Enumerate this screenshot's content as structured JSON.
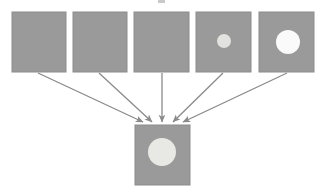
{
  "diagram": {
    "title": "",
    "type": "convergent-arrow-diagram",
    "canvas": {
      "width": 322,
      "height": 192,
      "background": "#ffffff"
    },
    "colors": {
      "box_fill": "#9a9a9a",
      "box_border": "#8c8c8c",
      "arrow_stroke": "#8a8a8a",
      "circle_bright": "#fafafa",
      "circle_medium": "#e2e2de",
      "circle_soft": "#e8e8e4",
      "page_background": "#ffffff"
    },
    "top_row": {
      "label": "source-frames-row",
      "count": 5,
      "boxes": [
        {
          "id": "frame-1",
          "label": "",
          "x": 12,
          "y": 12,
          "width": 54,
          "height": 60,
          "fill": "#9a9a9a",
          "circle": null
        },
        {
          "id": "frame-2",
          "label": "",
          "x": 73,
          "y": 12,
          "width": 54,
          "height": 60,
          "fill": "#9a9a9a",
          "circle": null
        },
        {
          "id": "frame-3",
          "label": "",
          "x": 134,
          "y": 12,
          "width": 55,
          "height": 60,
          "fill": "#9a9a9a",
          "circle": null
        },
        {
          "id": "frame-4",
          "label": "",
          "x": 196,
          "y": 12,
          "width": 55,
          "height": 60,
          "fill": "#9a9a9a",
          "circle": {
            "cx": 224,
            "cy": 41,
            "r": 7,
            "fill": "#e2e2de"
          }
        },
        {
          "id": "frame-5",
          "label": "",
          "x": 259,
          "y": 12,
          "width": 55,
          "height": 60,
          "fill": "#9a9a9a",
          "circle": {
            "cx": 288,
            "cy": 42,
            "r": 12,
            "fill": "#fafafa"
          }
        }
      ]
    },
    "target": {
      "id": "result-frame",
      "label": "",
      "x": 135,
      "y": 125,
      "width": 55,
      "height": 60,
      "fill": "#9a9a9a",
      "circle": {
        "cx": 162,
        "cy": 152,
        "r": 14,
        "fill": "#e8e8e4"
      }
    },
    "arrows": [
      {
        "id": "arrow-1",
        "from": "frame-1",
        "to": "result-frame",
        "x1": 38,
        "y1": 73,
        "x2": 143,
        "y2": 122
      },
      {
        "id": "arrow-2",
        "from": "frame-2",
        "to": "result-frame",
        "x1": 99,
        "y1": 73,
        "x2": 152,
        "y2": 122
      },
      {
        "id": "arrow-3",
        "from": "frame-3",
        "to": "result-frame",
        "x1": 162,
        "y1": 73,
        "x2": 162,
        "y2": 122
      },
      {
        "id": "arrow-4",
        "from": "frame-4",
        "to": "result-frame",
        "x1": 223,
        "y1": 73,
        "x2": 173,
        "y2": 122
      },
      {
        "id": "arrow-5",
        "from": "frame-5",
        "to": "result-frame",
        "x1": 287,
        "y1": 73,
        "x2": 183,
        "y2": 122
      }
    ],
    "artifacts": [
      {
        "id": "cropped-glyph-top",
        "x": 158,
        "y": 0,
        "width": 7,
        "height": 3,
        "fill": "#b8b8b8"
      }
    ]
  }
}
